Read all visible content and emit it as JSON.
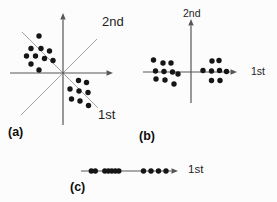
{
  "labels": {
    "a": {
      "second": "2nd",
      "first": "1st",
      "caption": "(a)"
    },
    "b": {
      "second": "2nd",
      "first": "1st",
      "caption": "(b)"
    },
    "c": {
      "first": "1st",
      "caption": "(c)"
    }
  },
  "style": {
    "background": "#fcfcfc",
    "axis_color": "#565656",
    "pc_line_color": "#a3a3a3",
    "dot_color": "#151515",
    "label_color": "#1e1e1e",
    "dot_radius": 2.7,
    "axis_width": 1.2,
    "pc_line_width": 1,
    "arrow_len": 6.5,
    "arrow_halfwidth": 2.7
  },
  "panels": [
    {
      "id": "a",
      "pc_lines": [
        [
          21,
          115,
          97,
          39
        ],
        [
          22,
          32,
          98,
          108
        ]
      ],
      "axes": [
        [
          63,
          125,
          63,
          13
        ],
        [
          10,
          73,
          113,
          73
        ]
      ],
      "dots": [
        [
          39,
          36
        ],
        [
          31,
          48.5
        ],
        [
          41,
          48.5
        ],
        [
          49.5,
          51
        ],
        [
          26.5,
          56
        ],
        [
          35.5,
          56
        ],
        [
          44.5,
          58.5
        ],
        [
          53,
          60.5
        ],
        [
          31,
          64
        ],
        [
          39,
          70
        ],
        [
          78.5,
          80.5
        ],
        [
          86.5,
          82.5
        ],
        [
          70,
          89
        ],
        [
          79,
          91
        ],
        [
          88,
          92.5
        ],
        [
          71.5,
          99
        ],
        [
          80,
          101
        ],
        [
          88.5,
          105.5
        ]
      ]
    },
    {
      "id": "b",
      "pc_lines": [],
      "axes": [
        [
          191,
          103,
          191,
          19
        ],
        [
          143,
          72,
          237,
          72
        ]
      ],
      "dots": [
        [
          153.5,
          60
        ],
        [
          163,
          63
        ],
        [
          171,
          63
        ],
        [
          155.5,
          71
        ],
        [
          164,
          71.5
        ],
        [
          172.5,
          72
        ],
        [
          178,
          74
        ],
        [
          156,
          79
        ],
        [
          165,
          80
        ],
        [
          174,
          84
        ],
        [
          212,
          61
        ],
        [
          219,
          60.5
        ],
        [
          203,
          70.5
        ],
        [
          211.5,
          71
        ],
        [
          219.5,
          70.5
        ],
        [
          226.5,
          71.5
        ],
        [
          211.5,
          80.5
        ],
        [
          220,
          80.5
        ]
      ]
    },
    {
      "id": "c",
      "pc_lines": [],
      "axes": [
        [
          81,
          171,
          178,
          171
        ]
      ],
      "dots": [
        [
          91.3,
          171
        ],
        [
          95.3,
          171
        ],
        [
          104.8,
          171
        ],
        [
          108.3,
          171
        ],
        [
          111.8,
          171
        ],
        [
          115.3,
          171
        ],
        [
          118.8,
          171
        ],
        [
          143.5,
          171
        ],
        [
          151,
          171
        ],
        [
          158.5,
          171
        ],
        [
          166,
          171
        ]
      ]
    }
  ]
}
